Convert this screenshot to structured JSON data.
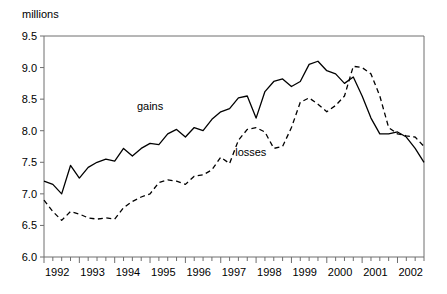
{
  "chart_data": {
    "type": "line",
    "title": "",
    "subtitle": "",
    "unit_label": "millions",
    "xlabel": "",
    "ylabel": "",
    "ylim": [
      6.0,
      9.5
    ],
    "yticks": [
      6.0,
      6.5,
      7.0,
      7.5,
      8.0,
      8.5,
      9.0,
      9.5
    ],
    "ytick_labels": [
      "6.0",
      "6.5",
      "7.0",
      "7.5",
      "8.0",
      "8.5",
      "9.0",
      "9.5"
    ],
    "xlim": [
      1992.0,
      2002.75
    ],
    "xtick_labels": [
      "1992",
      "1993",
      "1994",
      "1995",
      "1996",
      "1997",
      "1998",
      "1999",
      "2000",
      "2001",
      "2002"
    ],
    "x_minor_tick_interval": 0.25,
    "grid": false,
    "legend_position": "inline-annotation",
    "x": [
      1992.0,
      1992.25,
      1992.5,
      1992.75,
      1993.0,
      1993.25,
      1993.5,
      1993.75,
      1994.0,
      1994.25,
      1994.5,
      1994.75,
      1995.0,
      1995.25,
      1995.5,
      1995.75,
      1996.0,
      1996.25,
      1996.5,
      1996.75,
      1997.0,
      1997.25,
      1997.5,
      1997.75,
      1998.0,
      1998.25,
      1998.5,
      1998.75,
      1999.0,
      1999.25,
      1999.5,
      1999.75,
      2000.0,
      2000.25,
      2000.5,
      2000.75,
      2001.0,
      2001.25,
      2001.5,
      2001.75,
      2002.0,
      2002.25,
      2002.5,
      2002.75
    ],
    "series": [
      {
        "name": "gains",
        "style": "solid",
        "color": "#000000",
        "label_x": 1995.0,
        "label_y": 8.33,
        "values": [
          7.2,
          7.15,
          7.0,
          7.45,
          7.25,
          7.42,
          7.5,
          7.55,
          7.52,
          7.72,
          7.6,
          7.72,
          7.8,
          7.78,
          7.95,
          8.02,
          7.9,
          8.05,
          8.0,
          8.18,
          8.3,
          8.35,
          8.52,
          8.55,
          8.2,
          8.62,
          8.78,
          8.82,
          8.7,
          8.78,
          9.05,
          9.1,
          8.95,
          8.9,
          8.75,
          8.85,
          8.55,
          8.2,
          7.95,
          7.95,
          7.98,
          7.9,
          7.72,
          7.5
        ]
      },
      {
        "name": "losses",
        "style": "dashed",
        "color": "#000000",
        "label_x": 1997.85,
        "label_y": 7.6,
        "values": [
          6.9,
          6.72,
          6.58,
          6.72,
          6.68,
          6.62,
          6.6,
          6.62,
          6.6,
          6.78,
          6.88,
          6.95,
          7.0,
          7.18,
          7.22,
          7.2,
          7.15,
          7.28,
          7.3,
          7.38,
          7.58,
          7.48,
          7.85,
          8.02,
          8.05,
          7.98,
          7.72,
          7.75,
          8.05,
          8.45,
          8.52,
          8.42,
          8.3,
          8.4,
          8.55,
          9.02,
          9.0,
          8.9,
          8.55,
          8.05,
          7.95,
          7.92,
          7.9,
          7.75
        ]
      }
    ]
  }
}
